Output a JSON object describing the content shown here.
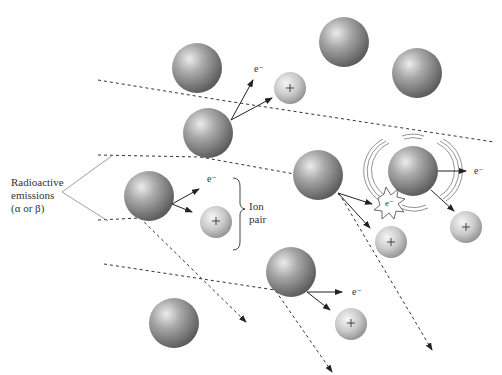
{
  "diagram": {
    "labels": {
      "radioactive_emissions": [
        "Radioactive",
        "emissions",
        "(α or β)"
      ],
      "ion_pair": [
        "Ion",
        "pair"
      ],
      "electron": "e⁻",
      "plus": "+"
    },
    "colors": {
      "atom_dark": "#6e6e6e",
      "atom_light": "#e8e8e8",
      "ion_dark": "#9a9a9a",
      "ion_light": "#f2f2f2",
      "line": "#222222",
      "pointer_line": "#888888"
    },
    "atoms": [
      {
        "id": "atom-1",
        "cx": 197,
        "cy": 68,
        "r": 25
      },
      {
        "id": "atom-2",
        "cx": 344,
        "cy": 42,
        "r": 25
      },
      {
        "id": "atom-3",
        "cx": 417,
        "cy": 73,
        "r": 25
      },
      {
        "id": "atom-4",
        "cx": 208,
        "cy": 133,
        "r": 25
      },
      {
        "id": "atom-5",
        "cx": 318,
        "cy": 175,
        "r": 25
      },
      {
        "id": "atom-6",
        "cx": 413,
        "cy": 171,
        "r": 25
      },
      {
        "id": "atom-7",
        "cx": 149,
        "cy": 196,
        "r": 25
      },
      {
        "id": "atom-8",
        "cx": 291,
        "cy": 272,
        "r": 25
      },
      {
        "id": "atom-9",
        "cx": 174,
        "cy": 323,
        "r": 25
      }
    ],
    "ions": [
      {
        "id": "ion-1",
        "cx": 290,
        "cy": 88,
        "r": 16
      },
      {
        "id": "ion-2",
        "cx": 216,
        "cy": 222,
        "r": 16
      },
      {
        "id": "ion-3",
        "cx": 391,
        "cy": 242,
        "r": 16
      },
      {
        "id": "ion-4",
        "cx": 466,
        "cy": 227,
        "r": 16
      },
      {
        "id": "ion-5",
        "cx": 351,
        "cy": 324,
        "r": 16
      }
    ],
    "electron_labels": [
      {
        "x": 254,
        "y": 60
      },
      {
        "x": 208,
        "y": 170
      },
      {
        "x": 472,
        "y": 164
      },
      {
        "x": 353,
        "y": 287
      }
    ],
    "knocked_electron": {
      "cx": 390,
      "cy": 207,
      "label": "e⁻"
    }
  }
}
